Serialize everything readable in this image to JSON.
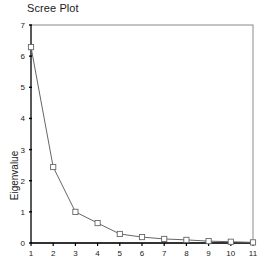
{
  "chart_data": {
    "type": "line",
    "title": "Scree Plot",
    "xlabel": "",
    "ylabel": "Eigenvalue",
    "x": [
      1,
      2,
      3,
      4,
      5,
      6,
      7,
      8,
      9,
      10,
      11
    ],
    "values": [
      6.29,
      2.44,
      1.0,
      0.64,
      0.29,
      0.19,
      0.13,
      0.1,
      0.06,
      0.04,
      0.02
    ],
    "series": [
      {
        "name": "Eigenvalue",
        "values": [
          6.29,
          2.44,
          1.0,
          0.64,
          0.29,
          0.19,
          0.13,
          0.1,
          0.06,
          0.04,
          0.02
        ]
      }
    ],
    "xtick_labels": [
      "1",
      "2",
      "3",
      "4",
      "5",
      "6",
      "7",
      "8",
      "9",
      "10",
      "11"
    ],
    "ytick_labels": [
      "0",
      "1",
      "2",
      "3",
      "4",
      "5",
      "6",
      "7"
    ],
    "ytick_values": [
      0,
      1,
      2,
      3,
      4,
      5,
      6,
      7
    ],
    "xlim": [
      1,
      11
    ],
    "ylim": [
      0,
      7
    ],
    "grid": false,
    "legend": "none",
    "marker": "square-open",
    "line_color": "#666666",
    "marker_color": "#666666",
    "axis_color": "#000000",
    "frame": "box"
  }
}
